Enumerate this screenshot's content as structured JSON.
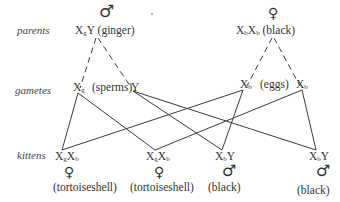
{
  "rows": {
    "parents": "parents",
    "gametes": "gametes",
    "kittens": "kittens"
  },
  "parents": {
    "father": {
      "sex_symbol": "♂",
      "genotype_base": "X",
      "genotype_sub": "g",
      "genotype_rest": "Y",
      "phenotype": "(ginger)"
    },
    "mother": {
      "sex_symbol": "♀",
      "genotype_a": "X",
      "genotype_a_sub": "b",
      "genotype_b": "X",
      "genotype_b_sub": "b",
      "phenotype": "(black)"
    }
  },
  "gametes": {
    "sperm_x": {
      "base": "X",
      "sub": "g"
    },
    "sperm_label": "(sperms)",
    "sperm_y": "Y",
    "egg_1": {
      "base": "X",
      "sub": "b"
    },
    "egg_label": "(eggs)",
    "egg_2": {
      "base": "X",
      "sub": "b"
    }
  },
  "kittens": [
    {
      "a": "X",
      "a_sub": "g",
      "b": "X",
      "b_sub": "b",
      "sex_symbol": "♀",
      "phenotype": "(tortoiseshell)"
    },
    {
      "a": "X",
      "a_sub": "g",
      "b": "X",
      "b_sub": "b",
      "sex_symbol": "♀",
      "phenotype": "(tortoiseshell)"
    },
    {
      "a": "X",
      "a_sub": "b",
      "b": "Y",
      "b_sub": "",
      "sex_symbol": "♂",
      "phenotype": "(black)"
    },
    {
      "a": "X",
      "a_sub": "b",
      "b": "Y",
      "b_sub": "",
      "sex_symbol": "♂",
      "phenotype": "(black)"
    }
  ],
  "colors": {
    "line": "#3a3a3a",
    "text": "#333333",
    "label": "#444444"
  }
}
